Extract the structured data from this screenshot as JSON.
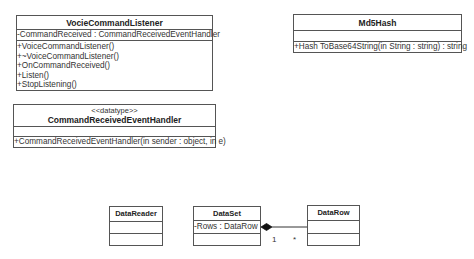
{
  "classes": {
    "voice_listener": {
      "name": "VocieCommandListener",
      "attributes": [
        "-CommandReceived : CommandReceivedEventHandler"
      ],
      "operations": [
        "+VoiceCommandListener()",
        "+~VoiceCommandListener()",
        "+OnCommandReceived()",
        "+Listen()",
        "+StopListening()"
      ]
    },
    "event_handler": {
      "stereotype": "<<datatype>>",
      "name": "CommandReceivedEventHandler",
      "attributes": [],
      "operations": [
        "+CommandReceivedEventHandler(in sender : object, in e)"
      ]
    },
    "md5hash": {
      "name": "Md5Hash",
      "attributes": [],
      "operations": [
        "+Hash ToBase64String(in String : string) : string"
      ]
    },
    "data_reader": {
      "name": "DataReader",
      "attributes": [],
      "operations": []
    },
    "data_set": {
      "name": "DataSet",
      "attributes": [
        "-Rows : DataRow"
      ],
      "operations": []
    },
    "data_row": {
      "name": "DataRow",
      "attributes": [],
      "operations": []
    }
  },
  "relationships": [
    {
      "type": "composition",
      "from": "DataSet",
      "to": "DataRow",
      "source_multiplicity": "1",
      "target_multiplicity": "*"
    }
  ],
  "colors": {
    "line": "#555555",
    "text": "#333333",
    "background": "#ffffff"
  }
}
